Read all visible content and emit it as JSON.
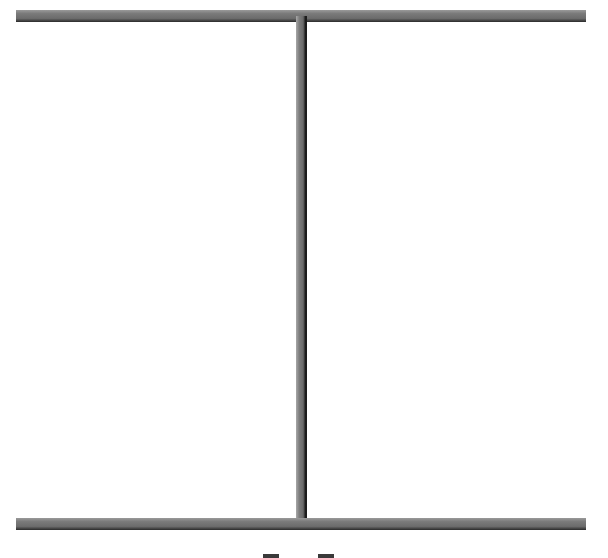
{
  "diagram": {
    "colors": {
      "bar_light": "#9a9a9a",
      "bar_mid": "#6c6c6c",
      "bar_shadow": "#2a2a2a",
      "mark": "#3a3a3a",
      "background": "#ffffff"
    },
    "elements": [
      {
        "name": "top-rail",
        "x": 16,
        "y": 10,
        "w": 570,
        "h": 12
      },
      {
        "name": "center-mullion",
        "x": 296,
        "y": 16,
        "w": 11,
        "h": 506
      },
      {
        "name": "bottom-rail",
        "x": 16,
        "y": 518,
        "w": 570,
        "h": 12
      },
      {
        "name": "left-foot-mark",
        "x": 263,
        "y": 554,
        "w": 16,
        "h": 4
      },
      {
        "name": "right-foot-mark",
        "x": 318,
        "y": 554,
        "w": 16,
        "h": 4
      }
    ]
  }
}
